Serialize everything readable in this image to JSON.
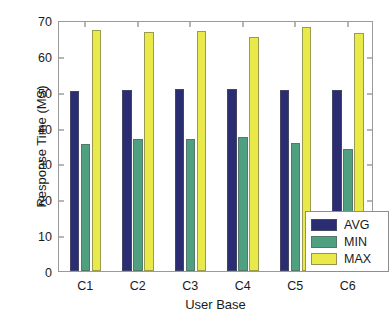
{
  "chart_data": {
    "type": "bar",
    "title": "",
    "xlabel": "User Base",
    "ylabel": "Response Time (MS)",
    "categories": [
      "C1",
      "C2",
      "C3",
      "C4",
      "C5",
      "C6"
    ],
    "series": [
      {
        "name": "AVG",
        "color": "#2b2d72",
        "values": [
          50.3,
          50.4,
          50.8,
          50.8,
          50.5,
          50.5
        ]
      },
      {
        "name": "MIN",
        "color": "#4fa080",
        "values": [
          35.3,
          36.8,
          36.8,
          37.3,
          35.6,
          34.1
        ]
      },
      {
        "name": "MAX",
        "color": "#e9e94a",
        "values": [
          67.1,
          66.6,
          67.0,
          65.2,
          68.1,
          66.5
        ]
      }
    ],
    "ylim": [
      0,
      70
    ],
    "yticks": [
      0,
      10,
      20,
      30,
      40,
      50,
      60,
      70
    ],
    "ytick_labels": [
      "0",
      "10",
      "20",
      "30",
      "40",
      "50",
      "60",
      "70"
    ],
    "grid": false,
    "legend_position": "lower-right",
    "legend_entries": [
      "AVG",
      "MIN",
      "MAX"
    ]
  }
}
